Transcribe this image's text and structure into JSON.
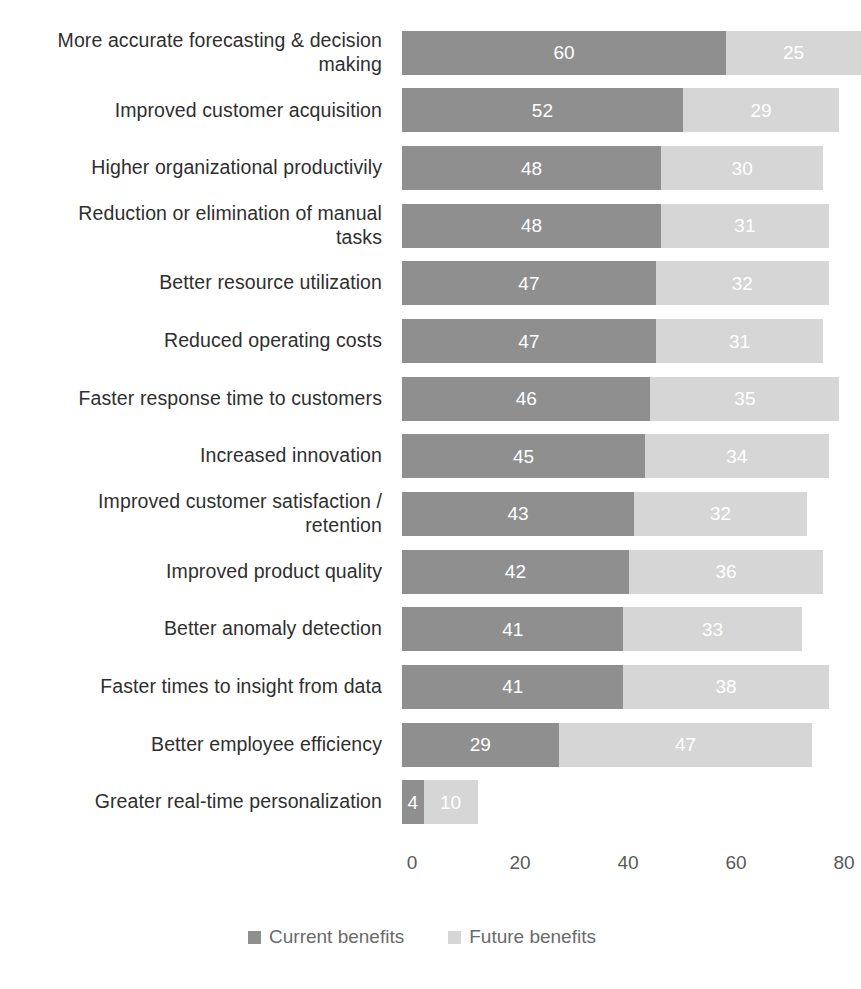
{
  "chart_data": {
    "type": "bar",
    "subtype": "stacked-horizontal",
    "title": "",
    "xlabel": "",
    "ylabel": "",
    "xlim": [
      0,
      88
    ],
    "xticks": [
      0,
      20,
      40,
      60,
      80
    ],
    "xtick_labels": [
      "0",
      "20",
      "40",
      "60",
      "80"
    ],
    "grid": false,
    "legend_position": "bottom-center",
    "categories": [
      "More accurate forecasting & decision\nmaking",
      "Improved customer acquisition",
      "Higher organizational productivily",
      "Reduction or elimination of manual\ntasks",
      "Better resource utilization",
      "Reduced operating costs",
      "Faster response time to customers",
      "Increased innovation",
      "Improved customer satisfaction /\nretention",
      "Improved product quality",
      "Better anomaly detection",
      "Faster times to insight from data",
      "Better employee efficiency",
      "Greater real-time personalization"
    ],
    "series": [
      {
        "name": "Current benefits",
        "color": "#8f8f8f",
        "values": [
          60,
          52,
          48,
          48,
          47,
          47,
          46,
          45,
          43,
          42,
          41,
          41,
          29,
          4
        ]
      },
      {
        "name": "Future benefits",
        "color": "#d6d6d6",
        "values": [
          25,
          29,
          30,
          31,
          32,
          31,
          35,
          34,
          32,
          36,
          33,
          38,
          47,
          10
        ]
      }
    ]
  },
  "legend": {
    "items": [
      {
        "label": "Current benefits",
        "color": "#8f8f8f"
      },
      {
        "label": "Future benefits",
        "color": "#d6d6d6"
      }
    ]
  }
}
